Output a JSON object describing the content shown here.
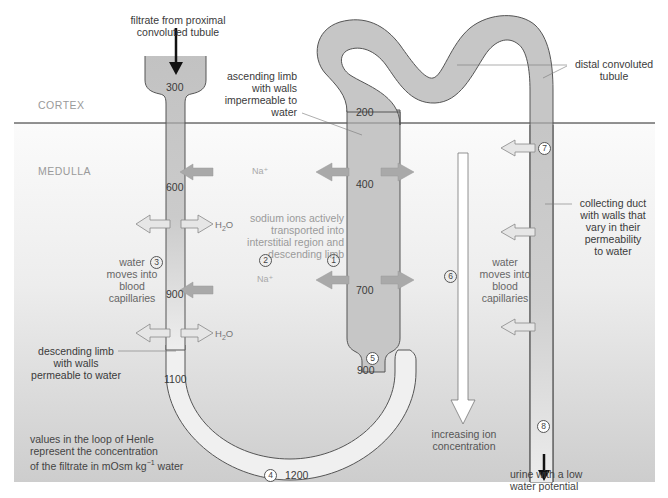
{
  "regions": {
    "cortex": "CORTEX",
    "medulla": "MEDULLA"
  },
  "labels": {
    "filtrate_in": [
      "filtrate from proximal",
      "convoluted tubule"
    ],
    "ascending_limb": [
      "ascending limb",
      "with walls",
      "impermeable to",
      "water"
    ],
    "distal_tubule": [
      "distal convoluted",
      "tubule"
    ],
    "collecting_duct": [
      "collecting duct",
      "with walls that",
      "vary in their",
      "permeability",
      "to water"
    ],
    "sodium_transport": [
      "sodium ions actively",
      "transported into",
      "interstitial region and",
      "descending limb"
    ],
    "water_left": [
      "water",
      "moves into",
      "blood",
      "capillaries"
    ],
    "water_right": [
      "water",
      "moves into",
      "blood",
      "capillaries"
    ],
    "descending_limb": [
      "descending limb",
      "with walls",
      "permeable to water"
    ],
    "increasing_ion": [
      "increasing ion",
      "concentration"
    ],
    "urine": [
      "urine with a low",
      "water potential"
    ],
    "values_note_1": "values in the loop of Henle",
    "values_note_2": "represent the concentration",
    "values_note_3a": "of the filtrate in mOsm kg",
    "values_note_3sup": "−1",
    "values_note_3b": " water"
  },
  "ions": {
    "na": "Na⁺",
    "h2o_main": "H",
    "h2o_sub": "2",
    "h2o_end": "O"
  },
  "concentrations": {
    "descending": [
      "300",
      "600",
      "900",
      "1100"
    ],
    "bottom": "1200",
    "ascending": [
      "900",
      "700",
      "400",
      "200"
    ]
  },
  "steps": [
    "1",
    "2",
    "3",
    "4",
    "5",
    "6",
    "7",
    "8"
  ],
  "colors": {
    "tubule_fill": "#c4c4c4",
    "tubule_light": "#e6e6e6",
    "tubule_stroke": "#555555",
    "na_arrow": "#a9a9a9",
    "water_arrow": "#e4e4e4",
    "medulla_top": "#fafafa",
    "medulla_bottom": "#cfcfcf",
    "divider": "#555555"
  }
}
